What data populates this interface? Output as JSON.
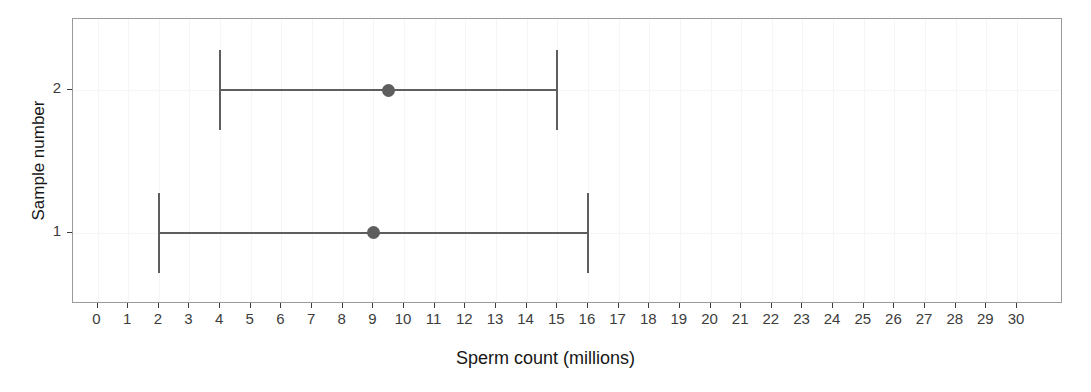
{
  "chart_data": {
    "type": "scatter",
    "title": "",
    "subtitle": "",
    "xlabel": "Sperm count (millions)",
    "ylabel": "Sample number",
    "xlim": [
      -0.8,
      31.5
    ],
    "ylim": [
      0.5,
      2.5
    ],
    "xticks": [
      0,
      1,
      2,
      3,
      4,
      5,
      6,
      7,
      8,
      9,
      10,
      11,
      12,
      13,
      14,
      15,
      16,
      17,
      18,
      19,
      20,
      21,
      22,
      23,
      24,
      25,
      26,
      27,
      28,
      29,
      30
    ],
    "xtick_labels": [
      "0",
      "1",
      "2",
      "3",
      "4",
      "5",
      "6",
      "7",
      "8",
      "9",
      "10",
      "11",
      "12",
      "13",
      "14",
      "15",
      "16",
      "17",
      "18",
      "19",
      "20",
      "21",
      "22",
      "23",
      "24",
      "25",
      "26",
      "27",
      "28",
      "29",
      "30"
    ],
    "yticks": [
      1,
      2
    ],
    "ytick_labels": [
      "1",
      "2"
    ],
    "grid": "faint",
    "legend": "none",
    "orientation": "horizontal",
    "series": [
      {
        "name": "Confidence interval",
        "points": [
          {
            "label": "1",
            "y": 1,
            "estimate": 9,
            "lower": 2,
            "upper": 16
          },
          {
            "label": "2",
            "y": 2,
            "estimate": 9.5,
            "lower": 4,
            "upper": 15
          }
        ]
      }
    ],
    "colors": {
      "marker": "#5e5e5e",
      "errorbar": "#5e5e5e",
      "panel_border": "#9a9a9a",
      "gridline": "#f5f5f5",
      "tick_label": "#3c3c3c",
      "axis_title": "#161616",
      "background": "#ffffff"
    }
  }
}
